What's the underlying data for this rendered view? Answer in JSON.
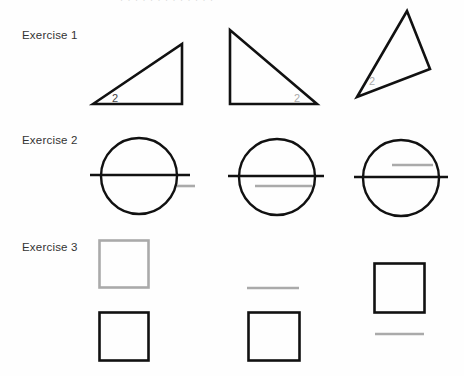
{
  "page": {
    "header_partial": "· · · · · ·   · · · · · · ·"
  },
  "exercises": [
    {
      "label": "Exercise 1",
      "angle_label": "2"
    },
    {
      "label": "Exercise 2"
    },
    {
      "label": "Exercise 3"
    }
  ],
  "colors": {
    "ink": "#111111",
    "guide_gray": "#aaaaaa",
    "label_gray": "#999999",
    "text": "#333333"
  }
}
